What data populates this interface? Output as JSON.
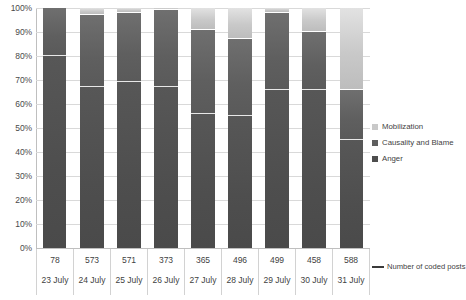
{
  "chart_data": {
    "type": "bar",
    "subtype": "100% stacked column",
    "title": "",
    "xlabel": "",
    "ylabel": "",
    "ylim": [
      0,
      100
    ],
    "ytick_labels": [
      "100%",
      "90%",
      "80%",
      "70%",
      "60%",
      "50%",
      "40%",
      "30%",
      "20%",
      "10%",
      "0%"
    ],
    "ytick_values": [
      100,
      90,
      80,
      70,
      60,
      50,
      40,
      30,
      20,
      10,
      0
    ],
    "grid": true,
    "legend_position": "right",
    "categories": [
      "23 July",
      "24 July",
      "25 July",
      "26 July",
      "27 July",
      "28 July",
      "29 July",
      "30 July",
      "31 July"
    ],
    "secondary_labels": {
      "name": "Number of coded posts",
      "values": [
        78,
        573,
        571,
        373,
        365,
        496,
        499,
        458,
        588
      ]
    },
    "annotation": "Number of coded posts",
    "series": [
      {
        "name": "Mobilization",
        "color": "#c9c9c9",
        "values": [
          0,
          3,
          2,
          1,
          9,
          13,
          2,
          10,
          34
        ]
      },
      {
        "name": "Causality and Blame",
        "color": "#5f5f5f",
        "values": [
          20,
          30,
          29,
          32,
          35,
          32,
          32,
          24,
          21
        ]
      },
      {
        "name": "Anger",
        "color": "#4e4e4e",
        "values": [
          80,
          67,
          69,
          67,
          56,
          55,
          66,
          66,
          45
        ]
      }
    ]
  },
  "legend": {
    "items": [
      {
        "label": "Mobilization",
        "color": "#c9c9c9"
      },
      {
        "label": "Causality and Blame",
        "color": "#5f5f5f"
      },
      {
        "label": "Anger",
        "color": "#4e4e4e"
      }
    ]
  }
}
